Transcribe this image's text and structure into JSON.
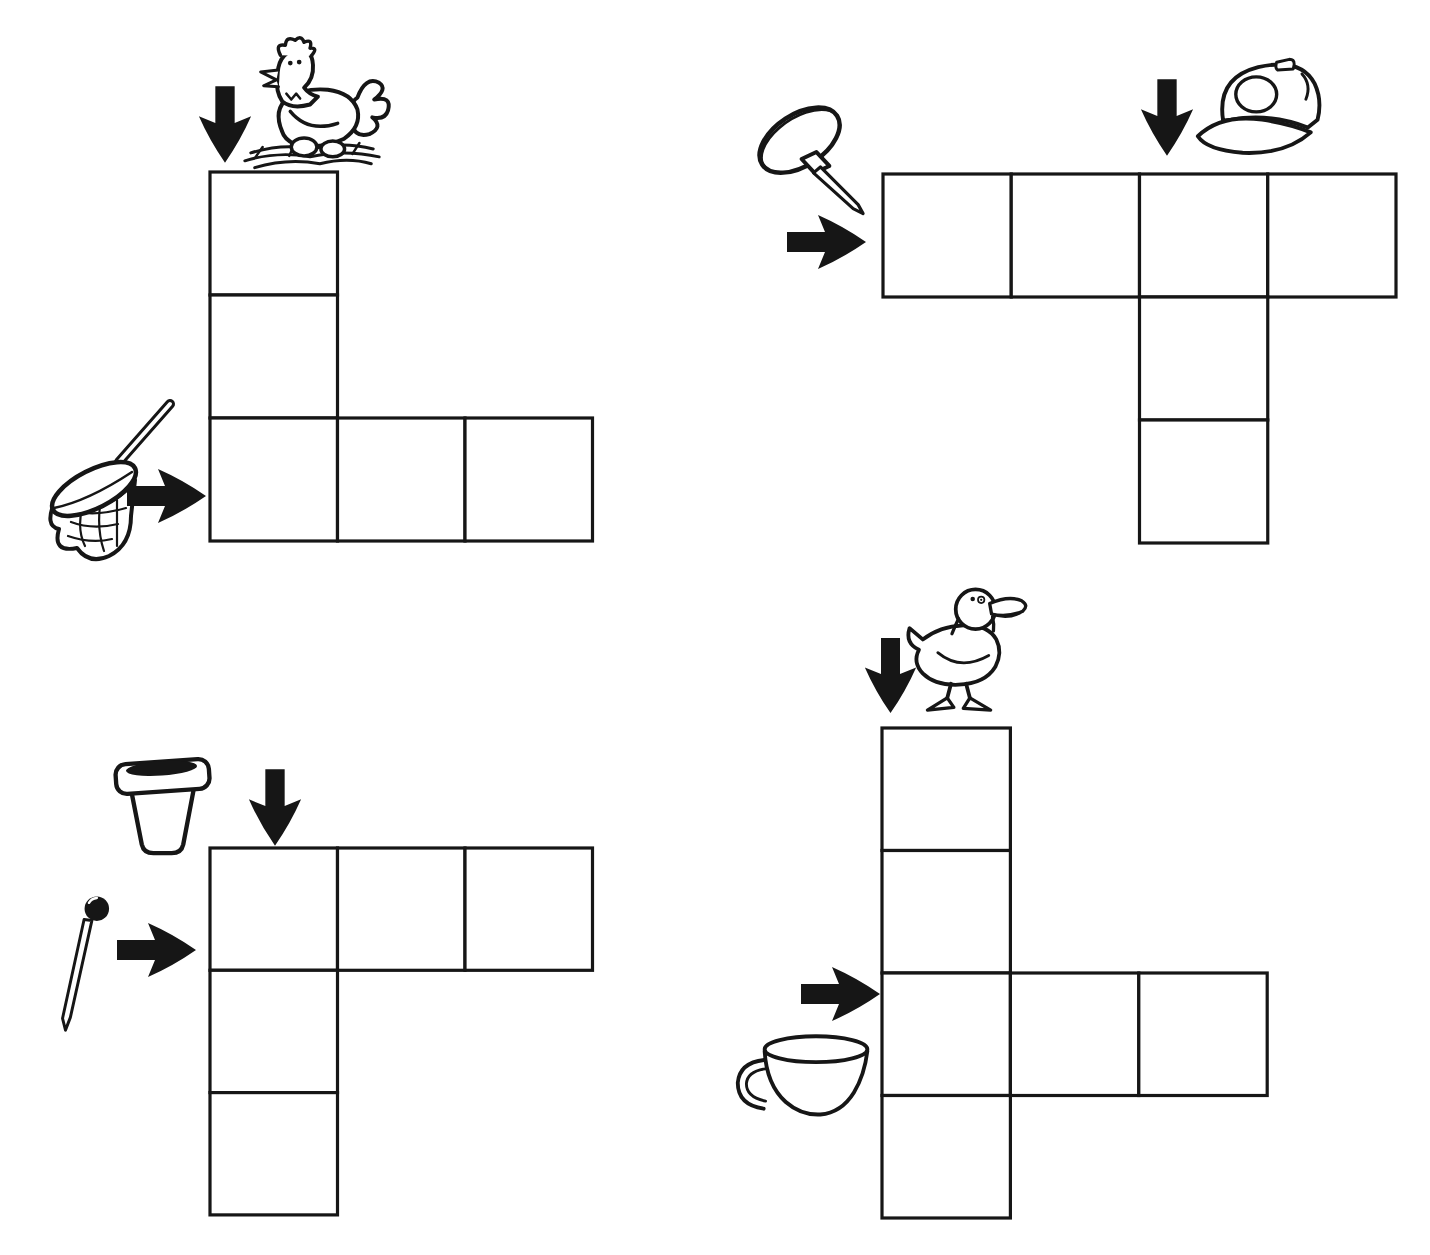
{
  "page": {
    "kind": "picture-crossword-worksheet",
    "width": 1430,
    "height": 1255,
    "background_color": "#ffffff",
    "ink_color": "#161616",
    "visible_text": ""
  },
  "puzzles": [
    {
      "name": "hen-net",
      "position": "top-left",
      "clues": [
        {
          "icon": "hen",
          "direction": "down",
          "answer_cells": 3
        },
        {
          "icon": "butterfly-net",
          "direction": "across",
          "answer_cells": 3
        }
      ],
      "grid": {
        "x": 210,
        "y": 172,
        "cell_w": 127.5,
        "cell_h": 123,
        "cells": [
          [
            0,
            0
          ],
          [
            0,
            1
          ],
          [
            0,
            2
          ],
          [
            1,
            2
          ],
          [
            2,
            2
          ]
        ]
      },
      "sprites": [
        {
          "icon": "arrow-down",
          "x": 196,
          "y": 84,
          "w": 58,
          "h": 82
        },
        {
          "icon": "hen",
          "x": 233,
          "y": 38,
          "w": 158,
          "h": 134
        },
        {
          "icon": "butterfly-net",
          "x": 46,
          "y": 398,
          "w": 130,
          "h": 175
        },
        {
          "icon": "arrow-right",
          "x": 126,
          "y": 466,
          "w": 82,
          "h": 60
        }
      ]
    },
    {
      "name": "tack-cap",
      "position": "top-right",
      "clues": [
        {
          "icon": "push-pin",
          "direction": "across",
          "answer_cells": 4
        },
        {
          "icon": "baseball-cap",
          "direction": "down",
          "answer_cells": 3
        }
      ],
      "grid": {
        "x": 883,
        "y": 174,
        "cell_w": 128.25,
        "cell_h": 123,
        "cells": [
          [
            0,
            0
          ],
          [
            1,
            0
          ],
          [
            2,
            0
          ],
          [
            3,
            0
          ],
          [
            2,
            1
          ],
          [
            2,
            2
          ]
        ]
      },
      "sprites": [
        {
          "icon": "push-pin",
          "x": 750,
          "y": 98,
          "w": 124,
          "h": 120
        },
        {
          "icon": "arrow-right",
          "x": 786,
          "y": 212,
          "w": 82,
          "h": 60
        },
        {
          "icon": "arrow-down",
          "x": 1138,
          "y": 76,
          "w": 58,
          "h": 84
        },
        {
          "icon": "baseball-cap",
          "x": 1192,
          "y": 54,
          "w": 146,
          "h": 108
        }
      ]
    },
    {
      "name": "pot-pin",
      "position": "bottom-left",
      "clues": [
        {
          "icon": "flower-pot",
          "direction": "down",
          "answer_cells": 3
        },
        {
          "icon": "sewing-pin",
          "direction": "across",
          "answer_cells": 3
        }
      ],
      "grid": {
        "x": 210,
        "y": 848,
        "cell_w": 127.5,
        "cell_h": 122.3,
        "cells": [
          [
            0,
            0
          ],
          [
            1,
            0
          ],
          [
            2,
            0
          ],
          [
            0,
            1
          ],
          [
            0,
            2
          ]
        ]
      },
      "sprites": [
        {
          "icon": "flower-pot",
          "x": 110,
          "y": 750,
          "w": 106,
          "h": 108
        },
        {
          "icon": "arrow-down",
          "x": 246,
          "y": 768,
          "w": 58,
          "h": 80
        },
        {
          "icon": "sewing-pin",
          "x": 58,
          "y": 894,
          "w": 60,
          "h": 142
        },
        {
          "icon": "arrow-right",
          "x": 116,
          "y": 920,
          "w": 82,
          "h": 60
        }
      ]
    },
    {
      "name": "duck-cup",
      "position": "bottom-right",
      "clues": [
        {
          "icon": "duck",
          "direction": "down",
          "answer_cells": 4
        },
        {
          "icon": "teacup",
          "direction": "across",
          "answer_cells": 3
        }
      ],
      "grid": {
        "x": 882,
        "y": 728,
        "cell_w": 128.4,
        "cell_h": 122.5,
        "cells": [
          [
            0,
            0
          ],
          [
            0,
            1
          ],
          [
            0,
            2
          ],
          [
            0,
            3
          ],
          [
            1,
            2
          ],
          [
            2,
            2
          ]
        ]
      },
      "sprites": [
        {
          "icon": "arrow-down",
          "x": 862,
          "y": 634,
          "w": 57,
          "h": 84
        },
        {
          "icon": "duck",
          "x": 902,
          "y": 582,
          "w": 132,
          "h": 146
        },
        {
          "icon": "arrow-right",
          "x": 798,
          "y": 964,
          "w": 86,
          "h": 60
        },
        {
          "icon": "teacup",
          "x": 732,
          "y": 1024,
          "w": 144,
          "h": 108
        }
      ]
    }
  ]
}
